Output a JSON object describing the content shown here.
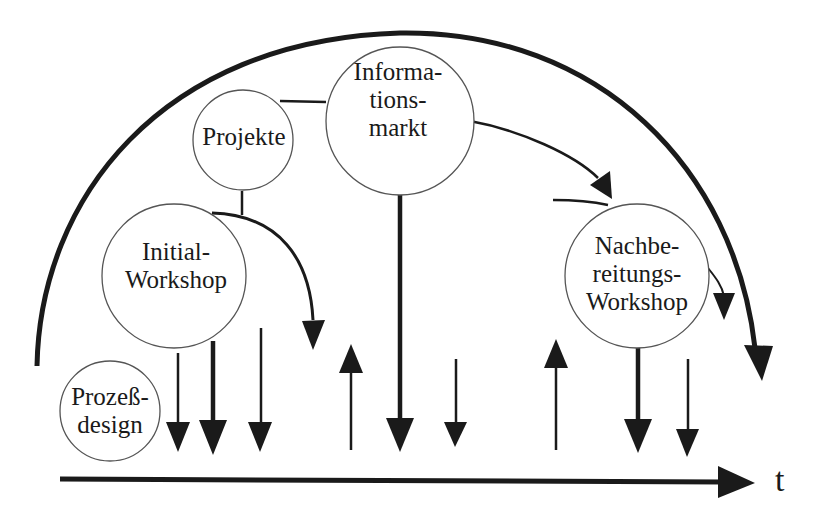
{
  "diagram": {
    "axis": {
      "label": "t"
    },
    "nodes": [
      {
        "id": "prozessdesign",
        "label": "Prozeß-\ndesign"
      },
      {
        "id": "initial-workshop",
        "label": "Initial-\nWorkshop"
      },
      {
        "id": "projekte",
        "label": "Projekte"
      },
      {
        "id": "informationsmarkt",
        "label": "Informa-\ntions-\nmarkt"
      },
      {
        "id": "nachbereitungs-workshop",
        "label": "Nachbe-\nreitungs-\nWorkshop"
      }
    ],
    "colors": {
      "stroke": "#1a1a1a",
      "node_border": "#555555",
      "background": "#ffffff"
    }
  }
}
